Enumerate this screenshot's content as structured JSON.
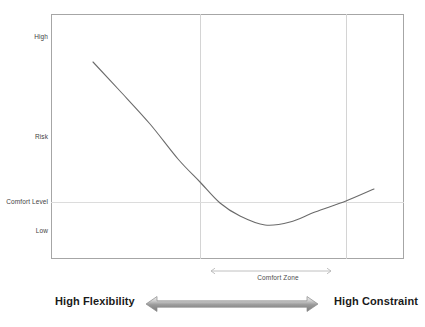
{
  "figure": {
    "cropped_title": "",
    "background_color": "#ffffff",
    "frame_color": "#a6a6a6",
    "grid_color": "#d4d4d4",
    "curve_color": "#6b6b6b",
    "accent_color": "#8c8c8c"
  },
  "y_axis": {
    "labels": [
      {
        "text": "High"
      },
      {
        "text": "Risk"
      },
      {
        "text": "Comfort Level"
      },
      {
        "text": "Low"
      }
    ]
  },
  "annotations": {
    "comfort_zone": "Comfort Zone",
    "left_end": "High Flexibility",
    "right_end": "High Constraint"
  },
  "chart_data": {
    "type": "line",
    "title": "",
    "xlabel": "",
    "ylabel": "Risk",
    "xlim": [
      0,
      100
    ],
    "ylim": [
      0,
      100
    ],
    "grid": true,
    "legend": "none",
    "y_tick_labels": [
      "High",
      "Risk",
      "Comfort Level",
      "Low"
    ],
    "y_tick_values": [
      92,
      51,
      24,
      13
    ],
    "x_gridlines": [
      42,
      84
    ],
    "y_gridlines": [
      24
    ],
    "annotations": {
      "comfort_zone_span": [
        45,
        79
      ],
      "comfort_zone_label": "Comfort Zone",
      "axis_left_label": "High Flexibility",
      "axis_right_label": "High Constraint"
    },
    "series": [
      {
        "name": "Risk vs Constraint",
        "x": [
          12,
          20,
          28,
          36,
          42,
          50,
          56,
          61,
          66,
          72,
          78,
          84,
          91
        ],
        "y": [
          80,
          68,
          56,
          44,
          36,
          25,
          19,
          16,
          15,
          17,
          21,
          26,
          33
        ]
      }
    ],
    "curve_points_px": [
      {
        "x": 93,
        "y": 62
      },
      {
        "x": 120,
        "y": 91
      },
      {
        "x": 150,
        "y": 124
      },
      {
        "x": 178,
        "y": 159
      },
      {
        "x": 200,
        "y": 182
      },
      {
        "x": 220,
        "y": 203
      },
      {
        "x": 240,
        "y": 216
      },
      {
        "x": 265,
        "y": 225
      },
      {
        "x": 290,
        "y": 222
      },
      {
        "x": 315,
        "y": 212
      },
      {
        "x": 346,
        "y": 201
      },
      {
        "x": 374,
        "y": 189
      }
    ]
  }
}
